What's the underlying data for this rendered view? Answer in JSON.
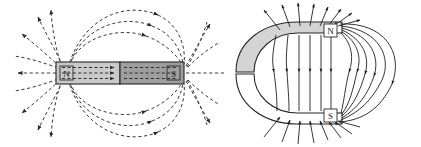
{
  "figure": {
    "name": "magnetic-field-lines-figure",
    "background_color": "#ffffff",
    "line_color": "#2b2b2b",
    "panels": [
      {
        "id": "bar-magnet-panel",
        "title": "",
        "magnet_type": "bar",
        "poles": [
          {
            "label": "N",
            "position": "left",
            "fill": "#c9c9c9"
          },
          {
            "label": "S",
            "position": "right",
            "fill": "#9e9e9e"
          }
        ],
        "field_line_style": "dashed",
        "arrowhead_style": "filled-triangle",
        "internal_field_direction": "south-to-north",
        "external_field_direction": "north-to-south"
      },
      {
        "id": "horseshoe-magnet-panel",
        "title": "",
        "magnet_type": "horseshoe",
        "poles": [
          {
            "label": "N",
            "position": "top-right",
            "fill": "#ffffff"
          },
          {
            "label": "S",
            "position": "bottom-right",
            "fill": "#ffffff"
          }
        ],
        "body_fill_shaded": "#d4d4d4",
        "body_fill_plain": "#ffffff",
        "field_line_style": "solid",
        "arrowhead_style": "filled-teardrop",
        "external_field_direction": "north-to-south"
      }
    ]
  }
}
